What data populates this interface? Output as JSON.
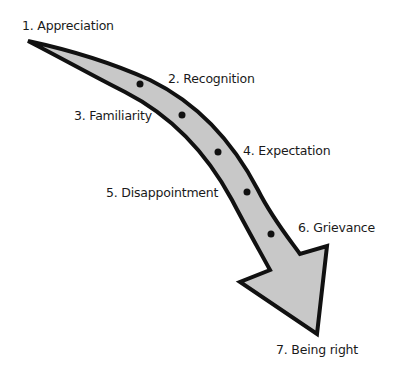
{
  "diagram": {
    "colors": {
      "arrow_fill": "#c8c8c8",
      "arrow_stroke": "#111111",
      "dot": "#111111",
      "text": "#1a1a1a",
      "background": "#ffffff"
    },
    "stages": [
      {
        "label": "1. Appreciation",
        "x": 22,
        "y": 21
      },
      {
        "label": "2. Recognition",
        "x": 168,
        "y": 73
      },
      {
        "label": "3. Familiarity",
        "x": 74,
        "y": 111
      },
      {
        "label": "4. Expectation",
        "x": 243,
        "y": 146
      },
      {
        "label": "5. Disappointment",
        "x": 106,
        "y": 188
      },
      {
        "label": "6. Grievance",
        "x": 298,
        "y": 223
      },
      {
        "label": "7. Being right",
        "x": 276,
        "y": 345
      }
    ],
    "arrow": {
      "direction": "down-right",
      "icon": "curved-arrow-icon"
    },
    "dots": [
      {
        "cx": 140,
        "cy": 84
      },
      {
        "cx": 182,
        "cy": 115
      },
      {
        "cx": 218,
        "cy": 152
      },
      {
        "cx": 247,
        "cy": 192
      },
      {
        "cx": 271,
        "cy": 234
      }
    ]
  }
}
